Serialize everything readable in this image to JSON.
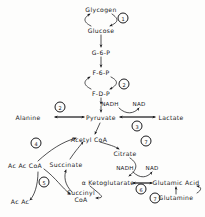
{
  "diagram": {
    "type": "hand-drawn-flowchart",
    "ink_color": "#17171a",
    "background_color": "#fdfdfc",
    "nodes": [
      {
        "id": "glycogen",
        "label": "Glycogen",
        "x": 101,
        "y": 9
      },
      {
        "id": "glucose",
        "label": "Glucose",
        "x": 101,
        "y": 30
      },
      {
        "id": "g6p",
        "label": "G-6-P",
        "x": 101,
        "y": 52
      },
      {
        "id": "f6p",
        "label": "F-6-P",
        "x": 101,
        "y": 72
      },
      {
        "id": "fdp",
        "label": "F-D-P",
        "x": 101,
        "y": 93
      },
      {
        "id": "pyruvate",
        "label": "Pyruvate",
        "x": 101,
        "y": 117
      },
      {
        "id": "alanine",
        "label": "Alanine",
        "x": 28,
        "y": 117
      },
      {
        "id": "lactate",
        "label": "Lactate",
        "x": 171,
        "y": 117
      },
      {
        "id": "nadh1",
        "label": "NADH",
        "x": 110,
        "y": 104
      },
      {
        "id": "nad1",
        "label": "NAD",
        "x": 139,
        "y": 104
      },
      {
        "id": "acetyl_coa",
        "label": "Acetyl  CoA",
        "x": 89,
        "y": 139
      },
      {
        "id": "citrate",
        "label": "Citrate",
        "x": 125,
        "y": 153
      },
      {
        "id": "akg",
        "label": "α Ketoglutarate",
        "x": 108,
        "y": 182
      },
      {
        "id": "nadh2",
        "label": "NADH",
        "x": 125,
        "y": 168
      },
      {
        "id": "nad2",
        "label": "NAD",
        "x": 152,
        "y": 168
      },
      {
        "id": "glutamic_acid",
        "label": "Glutamic  Acid",
        "x": 176,
        "y": 182
      },
      {
        "id": "glutamine",
        "label": "Glutamine",
        "x": 176,
        "y": 197
      },
      {
        "id": "succinate",
        "label": "Succinate",
        "x": 66,
        "y": 164
      },
      {
        "id": "succinyl_coa",
        "label": "Succinyl\nCoA",
        "x": 81,
        "y": 197
      },
      {
        "id": "acac_coa",
        "label": "Ac Ac CoA",
        "x": 25,
        "y": 165
      },
      {
        "id": "acac",
        "label": "Ac Ac",
        "x": 20,
        "y": 201
      }
    ],
    "steps": [
      {
        "number": "①",
        "label": "1",
        "x": 123,
        "y": 18
      },
      {
        "number": "②",
        "label": "2",
        "x": 124,
        "y": 84
      },
      {
        "number": "②",
        "label": "2",
        "x": 60,
        "y": 107
      },
      {
        "number": "③",
        "label": "3",
        "x": 137,
        "y": 126
      },
      {
        "number": "④",
        "label": "4",
        "x": 36,
        "y": 143
      },
      {
        "number": "⑤",
        "label": "5",
        "x": 44,
        "y": 182
      },
      {
        "number": "⑥",
        "label": "6",
        "x": 141,
        "y": 189
      },
      {
        "number": "⑦",
        "label": "7",
        "x": 155,
        "y": 198
      },
      {
        "number": "⑦",
        "label": "7",
        "x": 146,
        "y": 141
      }
    ],
    "edges": [
      {
        "from": "glycogen",
        "to": "glucose",
        "kind": "reversible-curve"
      },
      {
        "from": "glucose",
        "to": "g6p",
        "kind": "arrow-down"
      },
      {
        "from": "g6p",
        "to": "f6p",
        "kind": "arrow-down"
      },
      {
        "from": "f6p",
        "to": "fdp",
        "kind": "reversible-curve"
      },
      {
        "from": "fdp",
        "to": "pyruvate",
        "kind": "arrow-down"
      },
      {
        "from": "alanine",
        "to": "pyruvate",
        "kind": "double-arrow"
      },
      {
        "from": "pyruvate",
        "to": "lactate",
        "kind": "double-arrow"
      },
      {
        "from": "nadh1",
        "to": "nad1",
        "kind": "cofactor-curve"
      },
      {
        "from": "pyruvate",
        "to": "acetyl_coa",
        "kind": "arrow-down"
      },
      {
        "from": "acetyl_coa",
        "to": "citrate",
        "kind": "arrow"
      },
      {
        "from": "citrate",
        "to": "akg",
        "kind": "curve-arrow"
      },
      {
        "from": "nadh2",
        "to": "nad2",
        "kind": "cofactor-curve"
      },
      {
        "from": "akg",
        "to": "glutamic_acid",
        "kind": "double-arrow"
      },
      {
        "from": "glutamic_acid",
        "to": "glutamine",
        "kind": "double-arrow"
      },
      {
        "from": "akg",
        "to": "succinyl_coa",
        "kind": "curve-arrow"
      },
      {
        "from": "succinyl_coa",
        "to": "succinate",
        "kind": "curve-arrow"
      },
      {
        "from": "succinate",
        "to": "acetyl_coa",
        "kind": "curve-arrow"
      },
      {
        "from": "acac_coa",
        "to": "succinyl_coa",
        "kind": "curve-arrow"
      },
      {
        "from": "acac_coa",
        "to": "acac",
        "kind": "curve-arrow"
      },
      {
        "from": "acac_coa",
        "to": "acetyl_coa",
        "kind": "curve-arrow"
      }
    ]
  }
}
